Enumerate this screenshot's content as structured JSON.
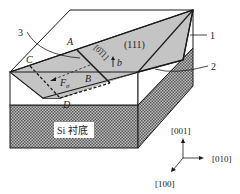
{
  "figure": {
    "plane_label": "(111)",
    "direction_label": "[0̅1̅1]",
    "burgers_label": "b",
    "force_label": "F",
    "force_subscript": "σ",
    "points": {
      "A": "A",
      "B": "B",
      "C": "C",
      "D": "D"
    },
    "callouts": {
      "c1": "1",
      "c2": "2",
      "c3": "3"
    },
    "substrate_label": "Si 衬底",
    "axes": {
      "z": "[001]",
      "y": "[010]",
      "x": "[100]"
    },
    "colors": {
      "line": "#1a1a1a",
      "plane_fill": "#c4c4c4",
      "substrate_dark": "#6e6e6e",
      "substrate_light": "#bdbdbd",
      "background": "#ffffff"
    }
  }
}
